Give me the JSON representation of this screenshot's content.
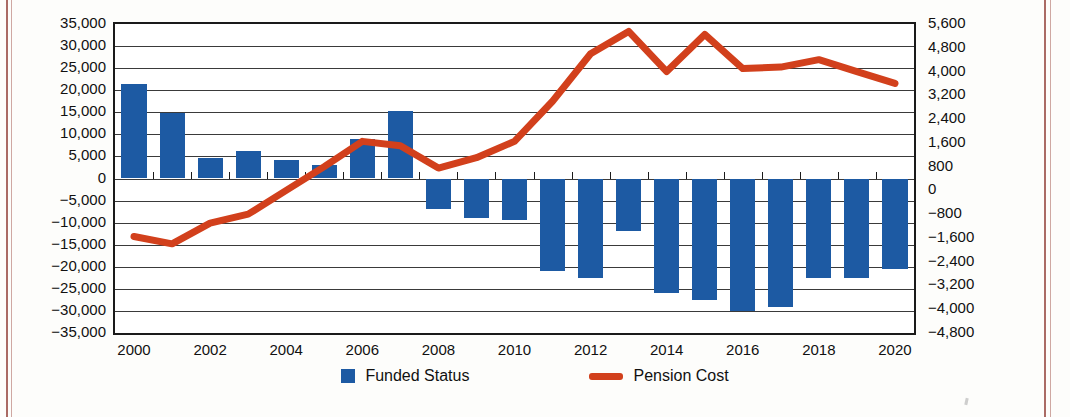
{
  "chart_data": {
    "type": "bar",
    "title": "",
    "subtitle": "",
    "xlabel": "",
    "ylabel": "",
    "grid": true,
    "legend_position": "bottom",
    "x": [
      2000,
      2001,
      2002,
      2003,
      2004,
      2005,
      2006,
      2007,
      2008,
      2009,
      2010,
      2011,
      2012,
      2013,
      2014,
      2015,
      2016,
      2017,
      2018,
      2019,
      2020
    ],
    "categories": [
      "2000",
      "2001",
      "2002",
      "2003",
      "2004",
      "2005",
      "2006",
      "2007",
      "2008",
      "2009",
      "2010",
      "2011",
      "2012",
      "2013",
      "2014",
      "2015",
      "2016",
      "2017",
      "2018",
      "2019",
      "2020"
    ],
    "xtick_labels": [
      "2000",
      "2002",
      "2004",
      "2006",
      "2008",
      "2010",
      "2012",
      "2014",
      "2016",
      "2018",
      "2020"
    ],
    "xtick_values": [
      2000,
      2002,
      2004,
      2006,
      2008,
      2010,
      2012,
      2014,
      2016,
      2018,
      2020
    ],
    "left_axis": {
      "ylim": [
        -35000,
        35000
      ],
      "tick_step": 5000,
      "tick_labels": [
        "35,000",
        "30,000",
        "25,000",
        "20,000",
        "15,000",
        "10,000",
        "5,000",
        "0",
        "−5,000",
        "−10,000",
        "−15,000",
        "−20,000",
        "−25,000",
        "−30,000",
        "−35,000"
      ],
      "tick_values": [
        35000,
        30000,
        25000,
        20000,
        15000,
        10000,
        5000,
        0,
        -5000,
        -10000,
        -15000,
        -20000,
        -25000,
        -30000,
        -35000
      ]
    },
    "right_axis": {
      "ylim": [
        -4800,
        5600
      ],
      "tick_step": 800,
      "tick_labels": [
        "5,600",
        "4,800",
        "4,000",
        "3,200",
        "2,400",
        "1,600",
        "800",
        "0",
        "−800",
        "−1,600",
        "−2,400",
        "−3,200",
        "−4,000",
        "−4,800"
      ],
      "tick_values": [
        5600,
        4800,
        4000,
        3200,
        2400,
        1600,
        800,
        0,
        -800,
        -1600,
        -2400,
        -3200,
        -4000,
        -4800
      ]
    },
    "series": [
      {
        "name": "Funded Status",
        "kind": "bar",
        "axis": "left",
        "color": "#1d5aa3",
        "values": [
          21500,
          14800,
          4600,
          6200,
          4300,
          3000,
          9000,
          15200,
          -7000,
          -9000,
          -9500,
          -21000,
          -22500,
          -12000,
          -26000,
          -27500,
          -30000,
          -29000,
          -22500,
          -22500,
          -20500
        ]
      },
      {
        "name": "Pension Cost",
        "kind": "line",
        "axis": "right",
        "color": "#d2401c",
        "values": [
          -1550,
          -1800,
          -1100,
          -800,
          0,
          800,
          1650,
          1500,
          750,
          1100,
          1650,
          3000,
          4600,
          5350,
          4000,
          5250,
          4100,
          4150,
          4400,
          4000,
          3600
        ]
      }
    ]
  },
  "legend": {
    "items": [
      {
        "label": "Funded Status",
        "marker": "square-swatch",
        "color": "#1d5aa3"
      },
      {
        "label": "Pension Cost",
        "marker": "line-swatch",
        "color": "#d2401c"
      }
    ]
  }
}
